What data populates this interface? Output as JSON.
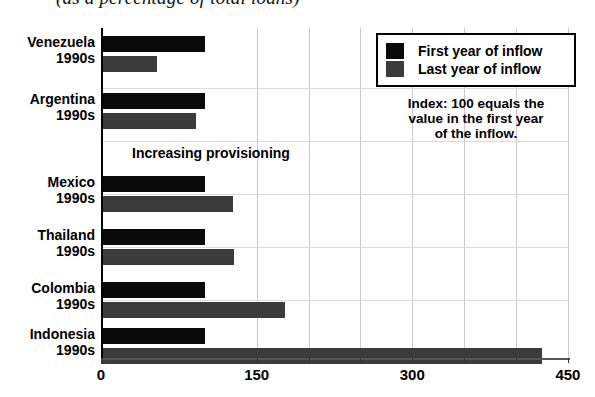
{
  "chart_data": {
    "type": "bar",
    "orientation": "horizontal",
    "title": "(as a percentage of total loans)",
    "xlabel": "",
    "ylabel": "",
    "xlim": [
      0,
      450
    ],
    "xticks": [
      "0",
      "150",
      "300",
      "450"
    ],
    "grid": true,
    "categories": [
      {
        "name": "Venezuela",
        "period": "1990s"
      },
      {
        "name": "Argentina",
        "period": "1990s"
      },
      {
        "name": "Mexico",
        "period": "1990s"
      },
      {
        "name": "Thailand",
        "period": "1990s"
      },
      {
        "name": "Colombia",
        "period": "1990s"
      },
      {
        "name": "Indonesia",
        "period": "1990s"
      }
    ],
    "series": [
      {
        "name": "First year of inflow",
        "color": "#0a0a0a",
        "values": [
          100,
          100,
          100,
          100,
          100,
          100
        ]
      },
      {
        "name": "Last year of inflow",
        "color": "#3b3b3b",
        "values": [
          54,
          92,
          127,
          128,
          177,
          425
        ]
      }
    ],
    "annotation": "Increasing provisioning",
    "note": [
      "Index: 100 equals the",
      "value in the first year",
      "of the inflow."
    ],
    "legend_position": "top-right"
  }
}
